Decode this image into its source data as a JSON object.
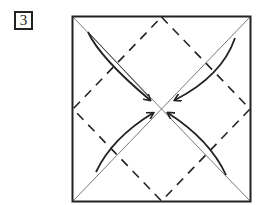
{
  "step": {
    "number": "3"
  },
  "diagram": {
    "square": {
      "x": 72,
      "y": 16,
      "size_w": 179,
      "size_h": 185
    },
    "colors": {
      "stroke": "#222222",
      "thin": "#555555"
    },
    "arrows": [
      "top-left-to-center",
      "top-right-to-center",
      "bottom-left-to-center",
      "bottom-right-to-center"
    ]
  }
}
